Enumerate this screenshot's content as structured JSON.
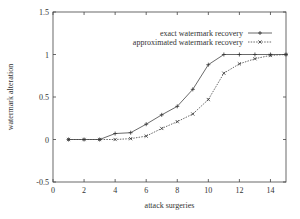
{
  "chart_data": {
    "type": "line",
    "title": "",
    "xlabel": "attack surgeries",
    "ylabel": "watermark alteration",
    "xlim": [
      0,
      15
    ],
    "ylim": [
      -0.5,
      1.5
    ],
    "xticks": [
      0,
      2,
      4,
      6,
      8,
      10,
      12,
      14
    ],
    "yticks": [
      -0.5,
      0,
      0.5,
      1,
      1.5
    ],
    "xtick_labels": [
      "0",
      "2",
      "4",
      "6",
      "8",
      "10",
      "12",
      "14"
    ],
    "ytick_labels": [
      "-0.5",
      "0",
      "0.5",
      "1",
      "1.5"
    ],
    "grid": false,
    "legend_position": "upper right (inside)",
    "x": [
      1,
      2,
      3,
      4,
      5,
      6,
      7,
      8,
      9,
      10,
      11,
      12,
      13,
      14,
      15
    ],
    "series": [
      {
        "name": "exact watermark recovery",
        "style": "solid",
        "marker": "+",
        "values": [
          0,
          0,
          0,
          0.07,
          0.08,
          0.18,
          0.29,
          0.39,
          0.59,
          0.88,
          1.0,
          1.0,
          1.0,
          1.0,
          1.0
        ]
      },
      {
        "name": "approximated watermark recovery",
        "style": "dotted",
        "marker": "x",
        "values": [
          0,
          0,
          0,
          0,
          0.01,
          0.04,
          0.13,
          0.21,
          0.3,
          0.47,
          0.78,
          0.89,
          0.95,
          0.99,
          1.0
        ]
      }
    ]
  }
}
